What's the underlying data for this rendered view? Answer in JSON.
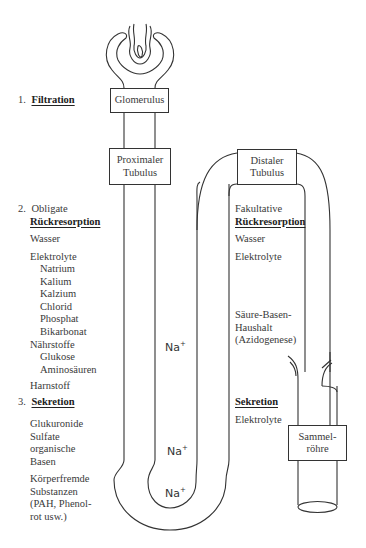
{
  "boxes": {
    "glomerulus": "Glomerulus",
    "proximal_line1": "Proximaler",
    "proximal_line2": "Tubulus",
    "distal_line1": "Distaler",
    "distal_line2": "Tubulus",
    "collecting_line1": "Sammel-",
    "collecting_line2": "röhre"
  },
  "left": {
    "step1": {
      "num": "1.",
      "label": "Filtration"
    },
    "step2": {
      "num": "2.",
      "label_line1": "Obligate",
      "label_line2": "Rückresorption"
    },
    "wasser": "Wasser",
    "elektrolyte": "Elektrolyte",
    "electrolyte_items": [
      "Natrium",
      "Kalium",
      "Kalzium",
      "Chlorid",
      "Phosphat",
      "Bikarbonat"
    ],
    "naehrstoffe": "Nährstoffe",
    "nutrient_items": [
      "Glukose",
      "Aminosäuren"
    ],
    "harnstoff": "Harnstoff",
    "step3": {
      "num": "3.",
      "label": "Sekretion"
    },
    "secretion_group1": [
      "Glukuronide",
      "Sulfate",
      "organische",
      "Basen"
    ],
    "secretion_group2": [
      "Körperfremde",
      "Substanzen",
      "(PAH, Phenol-",
      "rot usw.)"
    ]
  },
  "right": {
    "fakultative": "Fakultative",
    "rueckresorption": "Rückresorption",
    "wasser": "Wasser",
    "elektrolyte": "Elektrolyte",
    "saeure_basen": [
      "Säure-Basen-",
      "Haushalt",
      "(Azidogenese)"
    ],
    "sekretion": "Sekretion",
    "sekretion_elektrolyte": "Elektrolyte"
  },
  "ions": {
    "na1": "Na",
    "na2": "Na",
    "na3": "Na",
    "charge": "+"
  }
}
